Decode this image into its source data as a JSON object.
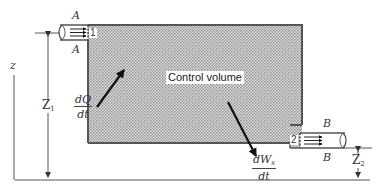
{
  "diagram": {
    "type": "control-volume-energy-balance",
    "control_volume": {
      "label": "Control volume",
      "fill": "#c8c8c8",
      "border": "#555555"
    },
    "inlet": {
      "port_number": "1",
      "section_label_top": "A",
      "section_label_bottom": "A"
    },
    "outlet": {
      "port_number": "2",
      "section_label_top": "B",
      "section_label_bottom": "B"
    },
    "heat_transfer": {
      "numerator": "dQ",
      "denominator": "dt",
      "direction": "into control volume"
    },
    "shaft_work": {
      "numerator_main": "dW",
      "numerator_sub": "s",
      "denominator": "dt",
      "direction": "out of control volume"
    },
    "elevations": {
      "axis_label": "z",
      "inlet_height": {
        "main": "Z",
        "sub": "1"
      },
      "outlet_height": {
        "main": "Z",
        "sub": "2"
      }
    }
  }
}
